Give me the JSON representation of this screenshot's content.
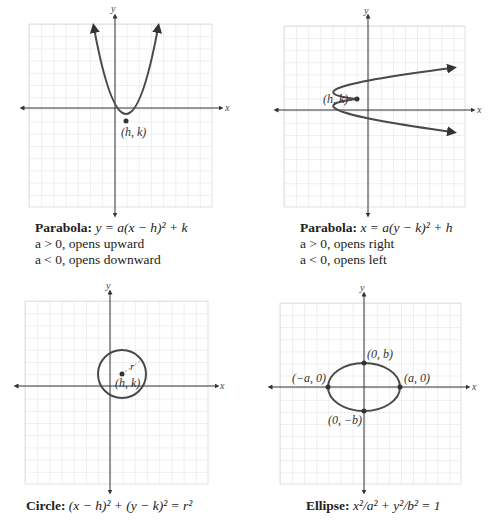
{
  "figure": {
    "top_partial_text": "… graph … figure …",
    "panels": [
      {
        "id": "parabola-vertical",
        "title": "Parabola:",
        "equation": "y = a(x − h)² + k",
        "notes": [
          "a > 0, opens upward",
          "a < 0, opens downward"
        ],
        "point_labels": [
          "(h, k)"
        ],
        "axis_labels": {
          "x": "x",
          "y": "y"
        }
      },
      {
        "id": "parabola-horizontal",
        "title": "Parabola:",
        "equation": "x = a(y − k)² + h",
        "notes": [
          "a > 0, opens right",
          "a < 0, opens left"
        ],
        "point_labels": [
          "(h, k)"
        ],
        "axis_labels": {
          "x": "x",
          "y": "y"
        }
      },
      {
        "id": "circle",
        "title": "Circle:",
        "equation": "(x − h)² + (y − k)² = r²",
        "notes": [],
        "point_labels": [
          "(h, k)",
          "r"
        ],
        "axis_labels": {
          "x": "x",
          "y": "y"
        }
      },
      {
        "id": "ellipse",
        "title": "Ellipse:",
        "equation": "x²/a² + y²/b² = 1",
        "notes": [],
        "point_labels": [
          "(0, b)",
          "(−a, 0)",
          "(a, 0)",
          "(0, −b)"
        ],
        "axis_labels": {
          "x": "x",
          "y": "y"
        }
      }
    ],
    "colors": {
      "curve": "#4a4a4a",
      "axis": "#333333",
      "grid": "#d9d9d9",
      "text": "#222222"
    }
  }
}
